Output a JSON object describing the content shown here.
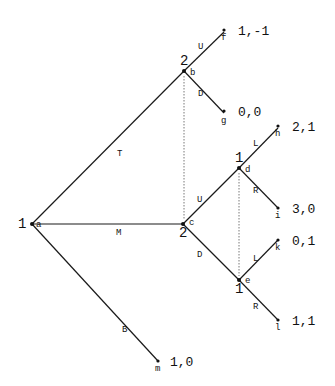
{
  "nodes": {
    "a": {
      "player": "1",
      "label": "a"
    },
    "b": {
      "player": "2",
      "label": "b"
    },
    "c": {
      "player": "2",
      "label": "c"
    },
    "d": {
      "player": "1",
      "label": "d"
    },
    "e": {
      "player": "1",
      "label": "e"
    },
    "f": {
      "label": "f",
      "payoff": "1,-1"
    },
    "g": {
      "label": "g",
      "payoff": "0,0"
    },
    "h": {
      "label": "h",
      "payoff": "2,1"
    },
    "i": {
      "label": "i",
      "payoff": "3,0"
    },
    "k": {
      "label": "k",
      "payoff": "0,1"
    },
    "l": {
      "label": "l",
      "payoff": "1,1"
    },
    "m": {
      "label": "m",
      "payoff": "1,0"
    }
  },
  "actions": {
    "T": "T",
    "M": "M",
    "B": "B",
    "bU": "U",
    "bD": "D",
    "cU": "U",
    "cD": "D",
    "dL": "L",
    "dR": "R",
    "eL": "L",
    "eR": "R"
  }
}
